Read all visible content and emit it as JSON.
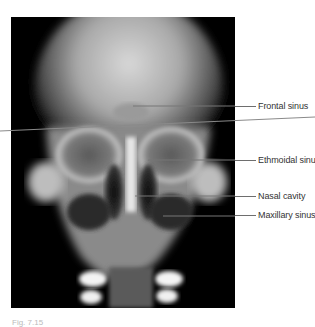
{
  "figure": {
    "type": "radiograph",
    "view": "frontal skull X-ray",
    "labels": [
      {
        "id": "frontal",
        "text": "Frontal sinus",
        "y": 106
      },
      {
        "id": "ethmoidal",
        "text": "Ethmoidal sinus",
        "y": 160
      },
      {
        "id": "nasal",
        "text": "Nasal cavity",
        "y": 196
      },
      {
        "id": "maxillary",
        "text": "Maxillary sinus",
        "y": 215
      }
    ],
    "caption": "Fig. 7.15"
  },
  "colors": {
    "background": "#ffffff",
    "image_bg": "#000000",
    "leader_line": "#6e6e6e",
    "label_text": "#333333"
  }
}
